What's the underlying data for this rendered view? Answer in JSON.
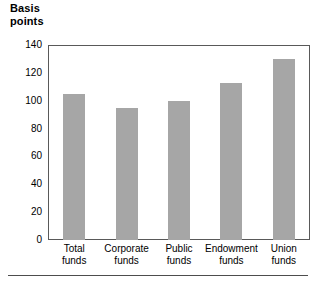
{
  "chart_data": {
    "type": "bar",
    "title": "Basis\npoints",
    "title_lines": [
      "Basis",
      "points"
    ],
    "xlabel": "",
    "ylabel": "Basis points",
    "categories": [
      "Total funds",
      "Corporate funds",
      "Public funds",
      "Endowment funds",
      "Union funds"
    ],
    "category_lines": [
      [
        "Total",
        "funds"
      ],
      [
        "Corporate",
        "funds"
      ],
      [
        "Public",
        "funds"
      ],
      [
        "Endowment",
        "funds"
      ],
      [
        "Union",
        "funds"
      ]
    ],
    "values": [
      105,
      95,
      100,
      113,
      130
    ],
    "ylim": [
      0,
      140
    ],
    "ytick_values": [
      0,
      20,
      40,
      60,
      80,
      100,
      120,
      140
    ],
    "ytick_labels": [
      "0",
      "20",
      "40",
      "60",
      "80",
      "100",
      "120",
      "140"
    ],
    "grid": false,
    "legend": null,
    "bar_color": "#a6a6a6",
    "frame_color": "#595959",
    "text_color": "#000000"
  }
}
